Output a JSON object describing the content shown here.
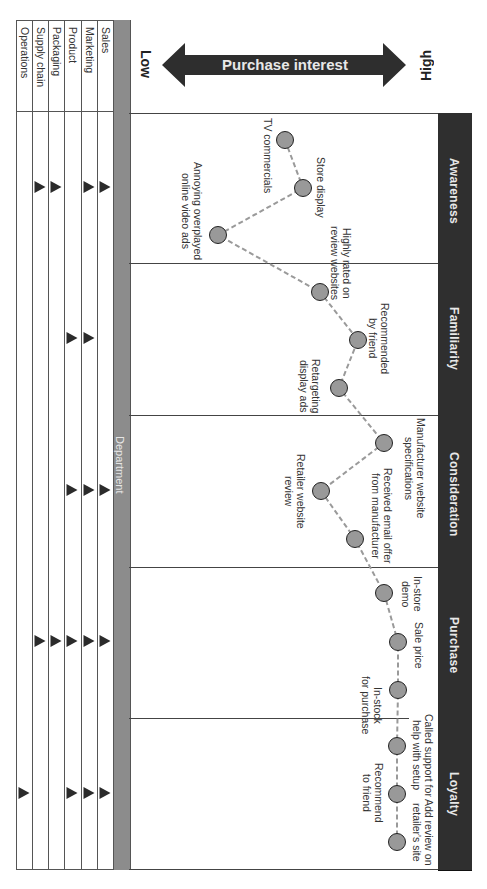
{
  "diagram": {
    "orientation": "rotated 90deg clockwise",
    "axis": {
      "label": "Purchase interest",
      "low_label": "Low",
      "high_label": "High"
    },
    "department_header": "Department",
    "departments": [
      "Sales",
      "Marketing",
      "Product",
      "Packaging",
      "Supply chain",
      "Operations"
    ],
    "phases": [
      {
        "label": "Awareness",
        "touchpoints": [
          "TV commercials",
          "Store display",
          "Annoying overplayed online video ads"
        ],
        "departments_involved": [
          "Sales",
          "Marketing",
          "Packaging",
          "Supply chain"
        ]
      },
      {
        "label": "Familiarity",
        "touchpoints": [
          "Highly rated on review websites",
          "Recommended by friend",
          "Retargeting display ads"
        ],
        "departments_involved": [
          "Marketing",
          "Product"
        ]
      },
      {
        "label": "Consideration",
        "touchpoints": [
          "Manufacturer website specifications",
          "Retailer website review",
          "Received email offer from manufacturer"
        ],
        "departments_involved": [
          "Sales",
          "Marketing",
          "Product"
        ]
      },
      {
        "label": "Purchase",
        "touchpoints": [
          "In-store demo",
          "Sale price",
          "In-stock for purchase"
        ],
        "departments_involved": [
          "Sales",
          "Marketing",
          "Product",
          "Packaging",
          "Supply chain"
        ]
      },
      {
        "label": "Loyalty",
        "touchpoints": [
          "Called support for help with setup",
          "Recommend to friend",
          "Add review on retailer's site"
        ],
        "departments_involved": [
          "Sales",
          "Marketing",
          "Product",
          "Operations"
        ]
      }
    ],
    "nodes": [
      {
        "label_lines": [
          "TV commercials"
        ],
        "x": 285,
        "y": 140,
        "lx": 262,
        "ly": 120
      },
      {
        "label_lines": [
          "Store display"
        ],
        "x": 303,
        "y": 188,
        "lx": 312,
        "ly": 160
      },
      {
        "label_lines": [
          "Annoying overplayed",
          "online video ads"
        ],
        "x": 218,
        "y": 235,
        "lx": 178,
        "ly": 162
      },
      {
        "label_lines": [
          "Highly rated on",
          "review websites"
        ],
        "x": 320,
        "y": 292,
        "lx": 326,
        "ly": 225
      },
      {
        "label_lines": [
          "Recommended",
          "by friend"
        ],
        "x": 358,
        "y": 340,
        "lx": 365,
        "ly": 303
      },
      {
        "label_lines": [
          "Retargeting",
          "display ads"
        ],
        "x": 339,
        "y": 388,
        "lx": 298,
        "ly": 360
      },
      {
        "label_lines": [
          "Manufacturer website",
          "specifications"
        ],
        "x": 384,
        "y": 443,
        "lx": 401,
        "ly": 415
      },
      {
        "label_lines": [
          "Retailer website",
          "review"
        ],
        "x": 321,
        "y": 491,
        "lx": 282,
        "ly": 452
      },
      {
        "label_lines": [
          "Received email offer",
          "from manufacturer"
        ],
        "x": 355,
        "y": 539,
        "lx": 370,
        "ly": 468
      },
      {
        "label_lines": [
          "In-store",
          "demo"
        ],
        "x": 384,
        "y": 593,
        "lx": 400,
        "ly": 575
      },
      {
        "label_lines": [
          "Sale price"
        ],
        "x": 398,
        "y": 642,
        "lx": 411,
        "ly": 621
      },
      {
        "label_lines": [
          "In-stock",
          "for purchase"
        ],
        "x": 398,
        "y": 690,
        "lx": 359,
        "ly": 676
      },
      {
        "label_lines": [
          "Called support for",
          "help with setup"
        ],
        "x": 397,
        "y": 746,
        "lx": 411,
        "ly": 712
      },
      {
        "label_lines": [
          "Recommend",
          "to friend"
        ],
        "x": 397,
        "y": 794,
        "lx": 360,
        "ly": 762
      },
      {
        "label_lines": [
          "Add review on",
          "retailer's site"
        ],
        "x": 397,
        "y": 842,
        "lx": 411,
        "ly": 798
      }
    ]
  },
  "colors": {
    "phase_bar": "#2f2f2f",
    "department_strip": "#8c8c8c",
    "node_fill": "#999999",
    "node_border": "#222222",
    "connector": "#9a9a9a",
    "triangle": "#2b2b2b"
  }
}
